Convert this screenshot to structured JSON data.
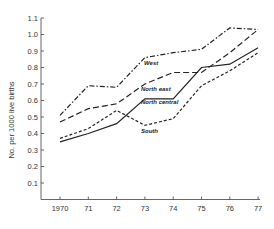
{
  "chart_data": {
    "type": "line",
    "title": "",
    "xlabel": "",
    "ylabel": "No. per 1000 live births",
    "x": [
      "1970",
      "71",
      "72",
      "73",
      "74",
      "75",
      "76",
      "77"
    ],
    "ylim": [
      0,
      1.1
    ],
    "yticks": [
      "0.1",
      "0.2",
      "0.3",
      "0.4",
      "0.5",
      "0.6",
      "0.7",
      "0.8",
      "0.9",
      "1.0",
      "1.1"
    ],
    "grid": false,
    "series": [
      {
        "name": "West",
        "style": "dash-dot",
        "values": [
          0.51,
          0.69,
          0.68,
          0.86,
          0.89,
          0.91,
          1.04,
          1.03
        ]
      },
      {
        "name": "North east",
        "style": "long-dash",
        "values": [
          0.47,
          0.55,
          0.58,
          0.7,
          0.77,
          0.77,
          0.89,
          1.03
        ]
      },
      {
        "name": "North central",
        "style": "solid",
        "values": [
          0.35,
          0.4,
          0.46,
          0.61,
          0.61,
          0.8,
          0.82,
          0.92
        ]
      },
      {
        "name": "South",
        "style": "short-dash",
        "values": [
          0.37,
          0.43,
          0.54,
          0.45,
          0.49,
          0.69,
          0.78,
          0.89
        ]
      }
    ]
  }
}
